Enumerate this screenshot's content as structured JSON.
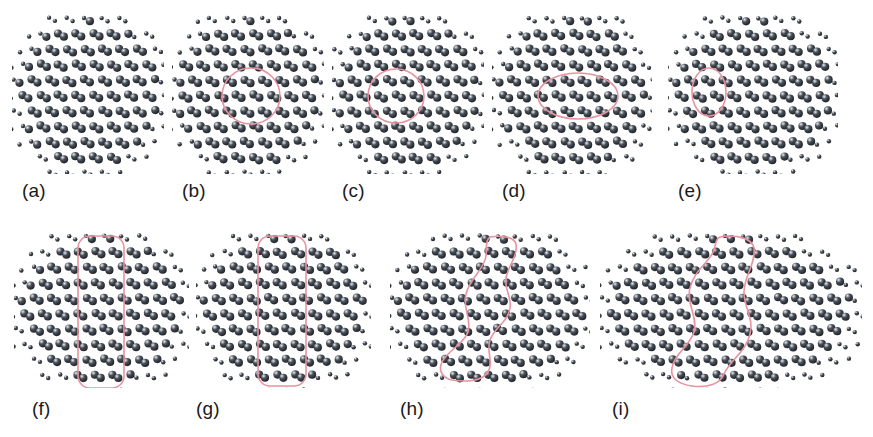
{
  "figure": {
    "kind": "scientific-figure",
    "background_color": "#ffffff",
    "atom": {
      "color_dark": "#1d2128",
      "color_mid": "#4a5058",
      "color_highlight": "#e9edf2",
      "bond_color": "#c9ced6",
      "radius_px": 4.1,
      "small_radius_px": 2.2
    },
    "highlight_color": "#e8939f",
    "highlight_stroke_width": 1.6,
    "label_color": "#1a1a1a",
    "label_font_size_px": 19
  },
  "lattice": {
    "type": "honeycomb",
    "a_x": 17.6,
    "a_y": 15.4,
    "basis_offset_x": 5.9,
    "basis_offset_y": 3.2,
    "cols": 9,
    "rows": 9
  },
  "panels": [
    {
      "id": "a",
      "label": "(a)",
      "label_x": 22,
      "label_y": 180,
      "x": 12,
      "y": 14,
      "width": 152,
      "height": 160,
      "highlight": null,
      "highlight_shape": "none",
      "note": "pristine lattice, no marked region"
    },
    {
      "id": "b",
      "label": "(b)",
      "label_x": 182,
      "label_y": 180,
      "x": 172,
      "y": 14,
      "width": 152,
      "height": 160,
      "highlight_shape": "circle",
      "highlight": {
        "cx": 79,
        "cy": 82,
        "rx": 29,
        "ry": 28,
        "rotate": 0
      }
    },
    {
      "id": "c",
      "label": "(c)",
      "label_x": 342,
      "label_y": 180,
      "x": 332,
      "y": 14,
      "width": 152,
      "height": 160,
      "highlight_shape": "circle",
      "highlight": {
        "cx": 64,
        "cy": 82,
        "rx": 28,
        "ry": 27,
        "rotate": 0
      }
    },
    {
      "id": "d",
      "label": "(d)",
      "label_x": 502,
      "label_y": 180,
      "x": 492,
      "y": 14,
      "width": 160,
      "height": 160,
      "highlight_shape": "ellipse",
      "highlight": {
        "cx": 86,
        "cy": 82,
        "rx": 40,
        "ry": 23,
        "rotate": 0
      }
    },
    {
      "id": "e",
      "label": "(e)",
      "label_x": 678,
      "label_y": 180,
      "x": 668,
      "y": 14,
      "width": 170,
      "height": 160,
      "highlight_shape": "ellipse",
      "highlight": {
        "cx": 41,
        "cy": 78,
        "rx": 17,
        "ry": 24,
        "rotate": 0
      }
    },
    {
      "id": "f",
      "label": "(f)",
      "label_x": 32,
      "label_y": 398,
      "x": 14,
      "y": 232,
      "width": 175,
      "height": 156,
      "highlight_shape": "rounded-rect",
      "highlight": {
        "x": 64,
        "y": 4,
        "w": 46,
        "h": 152,
        "r": 12
      }
    },
    {
      "id": "g",
      "label": "(g)",
      "label_x": 196,
      "label_y": 398,
      "x": 196,
      "y": 232,
      "width": 175,
      "height": 156,
      "highlight_shape": "rounded-rect",
      "highlight": {
        "x": 62,
        "y": 4,
        "w": 48,
        "h": 150,
        "r": 12
      }
    },
    {
      "id": "h",
      "label": "(h)",
      "label_x": 400,
      "label_y": 398,
      "x": 390,
      "y": 232,
      "width": 200,
      "height": 156,
      "highlight_shape": "blob",
      "highlight": {
        "path": "M 100 5 C 112 3 124 5 126 12 C 128 24 118 34 116 46 C 114 58 122 64 120 76 C 118 90 104 96 100 108 C 96 120 104 130 98 140 C 92 150 74 150 62 148 C 52 146 48 138 52 130 C 58 118 74 112 78 100 C 82 86 72 76 76 62 C 80 46 94 38 96 24 C 97 16 95 8 100 5 Z"
      }
    },
    {
      "id": "i",
      "label": "(i)",
      "label_x": 612,
      "label_y": 398,
      "x": 600,
      "y": 232,
      "width": 262,
      "height": 156,
      "highlight_shape": "blob",
      "highlight": {
        "path": "M 120 5 C 136 2 152 6 154 16 C 156 32 144 44 144 60 C 144 76 154 86 150 102 C 146 120 130 128 124 142 C 120 152 108 156 92 154 C 78 152 70 146 72 136 C 74 122 90 114 94 100 C 98 84 86 72 90 56 C 94 38 110 30 114 18 C 116 11 116 6 120 5 Z"
      }
    }
  ]
}
